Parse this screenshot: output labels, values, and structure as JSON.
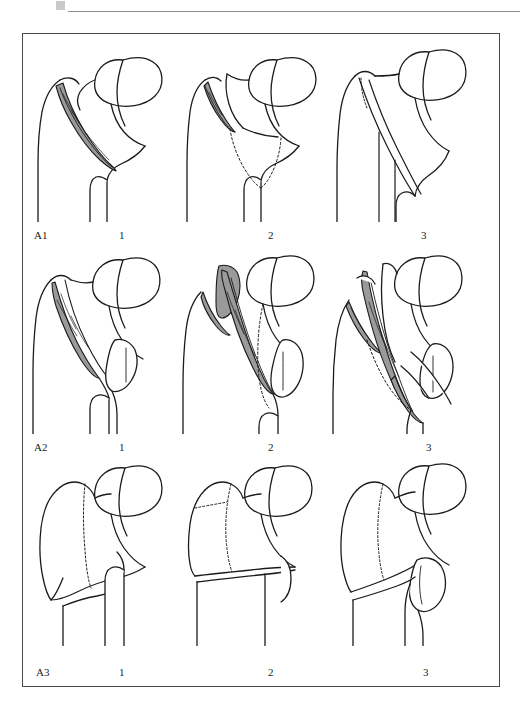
{
  "header": {
    "mark": "gray-square-mark",
    "text": "",
    "rule": "horizontal-rule"
  },
  "figure": {
    "caption": "",
    "classification_system": "AO/OTA proximal femur trochanteric fracture classification",
    "colors": {
      "outline": "#1b1b1b",
      "fracture_fill": "#9a9a9a",
      "bone_fill": "#ffffff",
      "frame_border": "#4a4a4a",
      "background": "#ffffff",
      "dotted_line": "#3a3a3a"
    },
    "rows": [
      {
        "row_label": "A1",
        "cells": [
          {
            "column_label": "1",
            "name": "a1-1",
            "description": "Simple pertrochanteric fracture, shaded oblique fracture line from greater trochanter to medial cortex"
          },
          {
            "column_label": "2",
            "name": "a1-2",
            "description": "Simple pertrochanteric fracture with shaded proximal fracture line and dotted displaced fragment outline"
          },
          {
            "column_label": "3",
            "name": "a1-3",
            "description": "Simple pertrochanteric fracture with long oblique line extending distally along the shaft, dotted trochanteric line"
          }
        ]
      },
      {
        "row_label": "A2",
        "cells": [
          {
            "column_label": "1",
            "name": "a2-1",
            "description": "Multifragmentary pertrochanteric fracture with one intermediate shaded fragment and detached lesser trochanter"
          },
          {
            "column_label": "2",
            "name": "a2-2",
            "description": "Multifragmentary pertrochanteric fracture with two shaded intermediate fragments and dotted displacement outline"
          },
          {
            "column_label": "3",
            "name": "a2-3",
            "description": "Multifragmentary pertrochanteric fracture with more than two shaded fragments extending beyond the lesser trochanter"
          }
        ]
      },
      {
        "row_label": "A3",
        "cells": [
          {
            "column_label": "1",
            "name": "a3-1",
            "description": "Intertrochanteric simple oblique fracture, reverse obliquity, with dotted intertrochanteric line"
          },
          {
            "column_label": "2",
            "name": "a3-2",
            "description": "Intertrochanteric simple transverse fracture with dotted intertrochanteric line"
          },
          {
            "column_label": "3",
            "name": "a3-3",
            "description": "Intertrochanteric multifragmentary fracture with medial wedge fragment"
          }
        ]
      }
    ]
  }
}
